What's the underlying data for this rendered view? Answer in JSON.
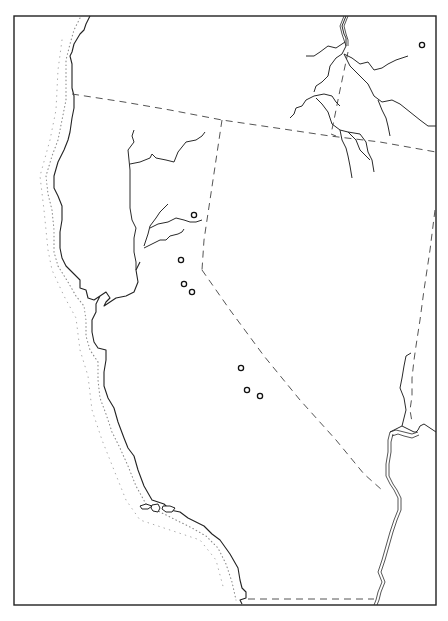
{
  "map": {
    "width": 448,
    "height": 621,
    "colors": {
      "ink": "#222222",
      "background": "#ffffff",
      "boundary": "#555555",
      "shelf": "#888888"
    },
    "frame": {
      "x": 14,
      "y": 16,
      "w": 422,
      "h": 589
    },
    "coastline": "M90,16 L86,24 L84,30 L80,34 L74,44 L72,52 L70,56 L72,64 L72,76 L72,88 L74,96 L74,108 L72,118 L70,132 L68,140 L64,150 L58,162 L54,176 L54,188 L58,196 L62,206 L62,220 L60,232 L60,248 L62,258 L66,266 L74,274 L80,280 L80,288 L86,290 L88,298 L94,300 L100,296 L106,292 L110,298 L106,302 L104,306 L116,298 L126,296 L134,292 L138,282 L136,270 L140,262 M100,296 L96,304 L96,312 L92,320 L92,332 L94,342 L98,348 L106,350 L106,360 L104,372 L104,386 L108,398 L114,408 L118,422 L124,438 L128,448 L134,456 L138,470 L144,486 L152,500 L164,504 L170,510 L180,512 L188,518 L196,522 L204,526 L212,534 L220,540 L230,554 L238,568 L240,580 L242,588 L246,592 L246,598 L240,600 L242,604",
    "shelf_line": "M80,18 L74,30 L70,44 L66,60 L66,80 L66,100 L62,120 L58,140 L52,156 L46,176 L48,194 L52,210 L54,230 L54,252 L58,266 L68,282 L76,296 L84,306 L86,320 L86,336 L90,350 L98,362 L98,380 L100,398 L106,414 L112,432 L120,448 L128,466 L136,486 L146,504 L160,512 L176,520 L192,528 L206,536 L218,548 L226,564 L232,582 L236,600",
    "shelf_line_outer": "M62,40 L58,70 L56,110 L50,140 L40,176 L44,210 L48,250 L52,270 L64,296 L76,318 L80,350 L88,376 L92,410 L102,440 L114,470 L126,500 L140,520 L170,530 L200,540 L216,560 L224,590",
    "islands": [
      {
        "d": "M140,506 L146,504 L152,506 L148,509 L142,509 Z"
      },
      {
        "d": "M152,505 L158,504 L160,508 L158,512 L153,511 L151,508 Z"
      },
      {
        "d": "M163,506 L170,506 L175,508 L172,512 L166,512 L162,509 Z"
      }
    ],
    "rivers": [
      {
        "name": "sacramento-river",
        "d": "M136,270 L136,262 L134,252 L134,238 L136,228 L132,220 L130,208 L130,190 L130,170 L129,160 L128,150 L134,142 L132,136 L134,130"
      },
      {
        "name": "pit-river",
        "d": "M130,164 L140,162 L150,158 L152,154 L156,158 L166,160 L174,162 L178,152 L186,142 L196,140 L202,136 L205,132"
      },
      {
        "name": "feather-river",
        "d": "M144,246 L148,234 L150,226 L156,218 L160,212 L166,206 L168,204"
      },
      {
        "name": "yuba-river",
        "d": "M150,228 L158,224 L168,222 L176,218 L184,220 L190,222 L196,222 L202,220"
      },
      {
        "name": "american-river",
        "d": "M144,248 L152,244 L160,240 L166,240 L170,236 L178,234 L182,232 L184,229"
      },
      {
        "name": "columbia-river-main",
        "d": "M346,16 L342,26 L344,34 L346,38 L346,46 L342,54 L336,58 L330,66 L328,76 L322,82 L316,86 L314,92"
      },
      {
        "name": "columbia-river-west",
        "d": "M345,42 L336,48 L328,46 L320,52 L314,56 L306,56"
      },
      {
        "name": "snake-river-east",
        "d": "M344,54 L352,58 L360,64 L368,62 L374,70 L382,68 L388,64 L396,60 L408,56"
      },
      {
        "name": "snake-river-lower",
        "d": "M344,54 L350,66 L360,76 L368,84 L374,96 L382,102 L392,100 L400,104 L410,112 L420,120 L428,126 L436,126"
      },
      {
        "name": "owyhee-river",
        "d": "M378,100 L382,110 L386,118 L388,126 L390,136"
      },
      {
        "name": "willamette-fork",
        "d": "M314,96 L306,100 L302,106 L296,108 L294,114 L290,118"
      },
      {
        "name": "deschutes-branch",
        "d": "M314,96 L324,94 L332,96 L336,102 L340,106"
      },
      {
        "name": "john-day-river",
        "d": "M316,98 L322,104 L328,112 L330,118 L332,124 L340,130 L348,132 L356,140 L360,150 L370,160"
      },
      {
        "name": "john-day-fork",
        "d": "M340,130 L342,140 L346,148 L348,156 L350,166 L352,178"
      },
      {
        "name": "silvies-river",
        "d": "M348,132 L360,134 L366,142 L368,152 L372,160 L374,172"
      },
      {
        "name": "colorado-river-upper",
        "d": "M411,353 L406,356 L404,366 L402,378 L400,388 L404,398 L406,410 L404,418 L402,426 L394,430 L390,432"
      },
      {
        "name": "gila-junction",
        "d": "M402,426 L406,428 L414,432 L416,432 L418,430 L420,426 L424,424 L430,428 L436,432"
      }
    ],
    "double_rivers": [
      {
        "name": "colorado-river-a",
        "d": "M390,432 L388,440 L388,452 L386,464 L386,476 L390,484 L394,490 L398,498 L398,510 L394,520 L390,532 L386,546 L382,560 L378,572 L382,582 L378,592 L376,600 L374,605"
      },
      {
        "name": "colorado-river-b",
        "d": "M393,434 L391,442 L391,452 L389,464 L389,476 L393,484 L397,490 L401,498 L401,510 L397,520 L393,532 L389,546 L385,560 L381,572 L385,582 L381,592 L379,600 L377,605"
      },
      {
        "name": "gila-river-a",
        "d": "M390,432 L396,430 L404,432 L412,434 L418,432"
      },
      {
        "name": "gila-river-b",
        "d": "M392,436 L398,434 L404,436 L412,438 L419,435"
      },
      {
        "name": "columbia-upper-a",
        "d": "M344,16 L340,26 L342,34 L344,40 L346,46"
      },
      {
        "name": "columbia-upper-b",
        "d": "M348,16 L344,26 L346,34 L348,40 L348,46"
      }
    ],
    "boundaries": [
      {
        "name": "oregon-california-border",
        "d": "M72,94 L124,102 L170,110 L222,120 L290,130 L330,136 L380,142 L436,152"
      },
      {
        "name": "idaho-oregon-border",
        "d": "M348,52 L340,90 L334,120 L331,134"
      },
      {
        "name": "oregon-idaho-offset",
        "d": "M331,134 L336,136"
      },
      {
        "name": "california-nevada-border-north",
        "d": "M222,120 L216,160 L210,200 L204,240 L202,270"
      },
      {
        "name": "california-nevada-border-diagonal",
        "d": "M202,270 L230,310 L264,356 L300,400 L336,440 L364,474 L382,490"
      },
      {
        "name": "nevada-arizona-border",
        "d": "M435,210 L430,250 L424,290 L420,320 L416,346 L414,360 L412,378 L412,396 L410,410 L412,422"
      },
      {
        "name": "mexico-border",
        "d": "M248,599 L290,599 L330,599 L374,599"
      }
    ],
    "sites": [
      {
        "name": "site-1",
        "cx": 194,
        "cy": 215
      },
      {
        "name": "site-2",
        "cx": 181,
        "cy": 260
      },
      {
        "name": "site-3",
        "cx": 184,
        "cy": 284
      },
      {
        "name": "site-4",
        "cx": 192,
        "cy": 292
      },
      {
        "name": "site-5",
        "cx": 241,
        "cy": 368
      },
      {
        "name": "site-6",
        "cx": 247,
        "cy": 390
      },
      {
        "name": "site-7",
        "cx": 260,
        "cy": 396
      },
      {
        "name": "site-8",
        "cx": 422,
        "cy": 45
      }
    ],
    "site_radius": 2.6
  }
}
